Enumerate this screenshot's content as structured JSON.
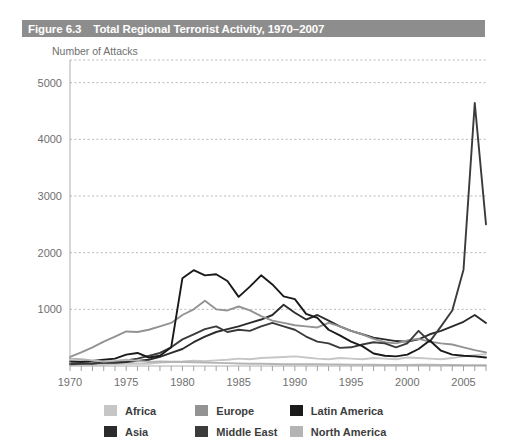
{
  "figure": {
    "number": "Figure 6.3",
    "title": "Total Regional Terrorist Activity, 1970–2007",
    "title_bar_color": "#8d8d8d",
    "title_text_color": "#ffffff"
  },
  "chart_data": {
    "type": "line",
    "title": "Total Regional Terrorist Activity, 1970–2007",
    "xlabel": "",
    "ylabel": "Number of Attacks",
    "ylim": [
      0,
      5400
    ],
    "xlim": [
      1970,
      2007
    ],
    "yticks": [
      1000,
      2000,
      3000,
      4000,
      5000
    ],
    "ytick_labels": [
      "1000",
      "2000",
      "3000",
      "4000",
      "5000"
    ],
    "xticks": [
      1970,
      1975,
      1980,
      1985,
      1990,
      1995,
      2000,
      2005
    ],
    "xtick_labels": [
      "1970",
      "1975",
      "1980",
      "1985",
      "1990",
      "1995",
      "2000",
      "2005"
    ],
    "minor_xticks_every": 1,
    "grid": "horizontal-dashed",
    "legend_position": "bottom",
    "x": [
      1970,
      1971,
      1972,
      1973,
      1974,
      1975,
      1976,
      1977,
      1978,
      1979,
      1980,
      1981,
      1982,
      1983,
      1984,
      1985,
      1986,
      1987,
      1988,
      1989,
      1990,
      1991,
      1992,
      1993,
      1994,
      1995,
      1996,
      1997,
      1998,
      1999,
      2000,
      2001,
      2002,
      2003,
      2004,
      2005,
      2006,
      2007
    ],
    "series": [
      {
        "name": "Africa",
        "color": "#c6c6c6",
        "values": [
          20,
          25,
          30,
          25,
          35,
          40,
          45,
          40,
          60,
          70,
          80,
          95,
          85,
          100,
          110,
          130,
          120,
          140,
          150,
          160,
          170,
          150,
          130,
          120,
          140,
          130,
          120,
          140,
          130,
          120,
          150,
          140,
          130,
          120,
          140,
          170,
          190,
          210
        ]
      },
      {
        "name": "Asia",
        "color": "#2b2b2b",
        "values": [
          40,
          50,
          45,
          60,
          55,
          70,
          90,
          110,
          160,
          230,
          300,
          420,
          520,
          600,
          650,
          700,
          760,
          820,
          900,
          1080,
          940,
          820,
          900,
          800,
          700,
          620,
          560,
          500,
          470,
          440,
          430,
          470,
          560,
          620,
          700,
          780,
          900,
          760
        ]
      },
      {
        "name": "Europe",
        "color": "#939393",
        "values": [
          160,
          240,
          330,
          430,
          520,
          610,
          600,
          640,
          700,
          760,
          900,
          1000,
          1150,
          1000,
          980,
          1050,
          980,
          880,
          800,
          760,
          720,
          700,
          680,
          760,
          700,
          620,
          560,
          480,
          420,
          400,
          450,
          480,
          430,
          400,
          380,
          330,
          280,
          240
        ]
      },
      {
        "name": "Middle East",
        "color": "#3b3b3b",
        "values": [
          30,
          40,
          45,
          60,
          75,
          100,
          130,
          180,
          230,
          330,
          470,
          560,
          650,
          700,
          600,
          640,
          620,
          700,
          760,
          700,
          640,
          520,
          430,
          400,
          320,
          330,
          380,
          420,
          400,
          330,
          400,
          620,
          430,
          700,
          980,
          1700,
          4640,
          2500
        ]
      },
      {
        "name": "Latin America",
        "color": "#1a1a1a",
        "values": [
          80,
          75,
          90,
          110,
          130,
          200,
          230,
          150,
          180,
          330,
          1550,
          1690,
          1600,
          1620,
          1500,
          1220,
          1400,
          1600,
          1440,
          1230,
          1180,
          920,
          850,
          640,
          540,
          430,
          350,
          220,
          180,
          170,
          200,
          300,
          450,
          270,
          200,
          180,
          170,
          150
        ]
      },
      {
        "name": "North America",
        "color": "#b4b4b4",
        "values": [
          130,
          120,
          100,
          80,
          90,
          110,
          90,
          70,
          80,
          75,
          70,
          65,
          60,
          55,
          50,
          45,
          40,
          40,
          35,
          30,
          30,
          30,
          30,
          28,
          26,
          25,
          24,
          22,
          20,
          20,
          20,
          25,
          22,
          20,
          18,
          16,
          15,
          14
        ]
      }
    ]
  },
  "legend": {
    "rows": [
      [
        {
          "label": "Africa",
          "color": "#c6c6c6"
        },
        {
          "label": "Europe",
          "color": "#939393"
        },
        {
          "label": "Latin America",
          "color": "#1a1a1a"
        }
      ],
      [
        {
          "label": "Asia",
          "color": "#2b2b2b"
        },
        {
          "label": "Middle East",
          "color": "#3b3b3b"
        },
        {
          "label": "North America",
          "color": "#b4b4b4"
        }
      ]
    ]
  }
}
